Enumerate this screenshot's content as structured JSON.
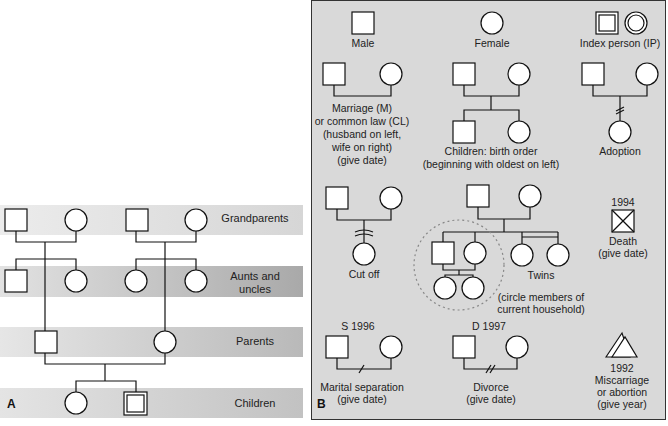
{
  "panel_a": {
    "letter": "A",
    "bands": [
      {
        "label": "Grandparents",
        "color": "#dcdcdc"
      },
      {
        "label_1": "Aunts and",
        "label_2": "uncles",
        "color": "#b4b4b4"
      },
      {
        "label": "Parents",
        "color": "#c4c4c4"
      },
      {
        "label": "Children",
        "color": "#cccccc"
      }
    ]
  },
  "panel_b": {
    "letter": "B",
    "background": "#d9d9d9",
    "legend": {
      "male": "Male",
      "female": "Female",
      "index_person": "Index person (IP)",
      "marriage": [
        "Marriage (M)",
        "or common law (CL)",
        "(husband on left,",
        "wife on right)",
        "(give date)"
      ],
      "children": [
        "Children: birth order",
        "(beginning with oldest on left)"
      ],
      "adoption": "Adoption",
      "cut_off": "Cut off",
      "twins": "Twins",
      "household": [
        "(circle members of",
        "current household)"
      ],
      "death_year": "1994",
      "death": [
        "Death",
        "(give date)"
      ],
      "separation_year": "S 1996",
      "separation": [
        "Marital separation",
        "(give date)"
      ],
      "divorce_year": "D 1997",
      "divorce": [
        "Divorce",
        "(give date)"
      ],
      "miscarriage_year": "1992",
      "miscarriage": [
        "Miscarriage",
        "or abortion",
        "(give year)"
      ]
    }
  }
}
